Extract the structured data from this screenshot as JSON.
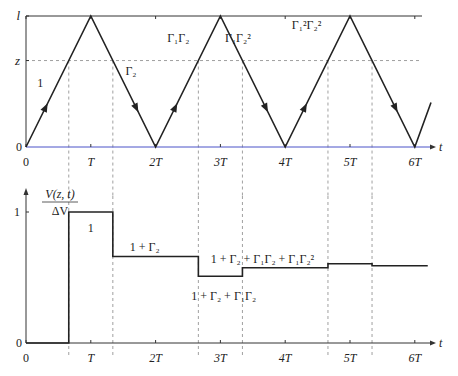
{
  "top_plot": {
    "y_labels": {
      "l": "l",
      "z": "z",
      "zero": "0"
    },
    "x_axis_label": "t",
    "x_tick_labels": [
      "0",
      "T",
      "2T",
      "3T",
      "4T",
      "5T",
      "6T"
    ],
    "segment_labels": [
      {
        "text": "1",
        "segment": 0
      },
      {
        "text": "Γ₂",
        "segment": 1
      },
      {
        "text": "Γ₁Γ₂",
        "segment": 2
      },
      {
        "text": "Γ₁Γ₂²",
        "segment": 3
      },
      {
        "text": "Γ₁²Γ₂²",
        "segment": 4
      }
    ],
    "wave_vertices": [
      [
        0,
        0
      ],
      [
        1,
        1
      ],
      [
        2,
        0
      ],
      [
        3,
        1
      ],
      [
        4,
        0
      ],
      [
        5,
        1
      ],
      [
        6,
        0
      ],
      [
        6.25,
        0.34
      ]
    ],
    "z_level": 0.66,
    "z_crossing_times": [
      0.66,
      1.34,
      2.66,
      3.34,
      4.66,
      5.34
    ]
  },
  "bottom_plot": {
    "y_axis_label_num": "V(z, t)",
    "y_axis_label_den": "ΔV",
    "y_tick_labels": [
      "0",
      "1"
    ],
    "x_axis_label": "t",
    "x_tick_labels": [
      "0",
      "T",
      "2T",
      "3T",
      "4T",
      "5T",
      "6T"
    ],
    "steps": [
      {
        "t_start": 0,
        "t_end": 0.66,
        "value": 0
      },
      {
        "t_start": 0.66,
        "t_end": 1.34,
        "value": 1.0,
        "label": "1"
      },
      {
        "t_start": 1.34,
        "t_end": 2.66,
        "value": 0.66,
        "label": "1 + Γ₂"
      },
      {
        "t_start": 2.66,
        "t_end": 3.34,
        "value": 0.51,
        "label": "1 + Γ₂ + Γ₁Γ₂"
      },
      {
        "t_start": 3.34,
        "t_end": 4.66,
        "value": 0.575,
        "label": "1 + Γ₂ + Γ₁Γ₂ + Γ₁Γ₂²"
      },
      {
        "t_start": 4.66,
        "t_end": 5.34,
        "value": 0.605
      },
      {
        "t_start": 5.34,
        "t_end": 6.2,
        "value": 0.59
      }
    ]
  }
}
